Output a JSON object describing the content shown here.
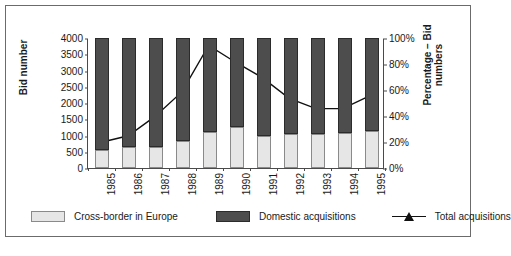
{
  "chart_data": {
    "type": "bar",
    "title": "",
    "subtitle": "",
    "xlabel": "",
    "ylabel": "Bid number",
    "ylabel_right": "Percentage – Bid numbers",
    "categories": [
      "1985",
      "1986",
      "1987",
      "1988",
      "1989",
      "1990",
      "1991",
      "1992",
      "1993",
      "1994",
      "1995"
    ],
    "ylim": [
      0,
      4000
    ],
    "yticks": [
      0,
      500,
      1000,
      1500,
      2000,
      2500,
      3000,
      3500,
      4000
    ],
    "ytick_labels": [
      "0",
      "500",
      "1000",
      "1500",
      "2000",
      "2500",
      "3000",
      "3500",
      "4000"
    ],
    "ylim_right": [
      0,
      100
    ],
    "yticks_right": [
      0,
      20,
      40,
      60,
      80,
      100
    ],
    "ytick_labels_right": [
      "0%",
      "20%",
      "40%",
      "60%",
      "80%",
      "100%"
    ],
    "grid": false,
    "legend_position": "bottom",
    "stacked": true,
    "series": [
      {
        "name": "Cross-border in Europe",
        "type": "bar",
        "axis": "left",
        "color": "#e6e6e6",
        "values": [
          560,
          660,
          640,
          820,
          1120,
          1250,
          970,
          1060,
          1060,
          1080,
          1150
        ]
      },
      {
        "name": "Domestic acquisitions",
        "type": "bar",
        "axis": "left",
        "color": "#4d4d4d",
        "values": [
          3440,
          3340,
          3360,
          3180,
          2880,
          2750,
          3030,
          2940,
          2940,
          2920,
          2850
        ]
      },
      {
        "name": "Total acquisitions",
        "type": "line",
        "axis": "right",
        "color": "#111111",
        "marker": "triangle",
        "values": [
          20,
          25,
          40,
          59,
          95,
          82,
          70,
          54,
          46,
          46,
          56
        ]
      }
    ]
  },
  "legend": {
    "items": [
      {
        "label": "Cross-border in Europe",
        "marker": "square-light"
      },
      {
        "label": "Domestic acquisitions",
        "marker": "square-dark"
      },
      {
        "label": "Total acquisitions",
        "marker": "line-triangle"
      }
    ]
  }
}
